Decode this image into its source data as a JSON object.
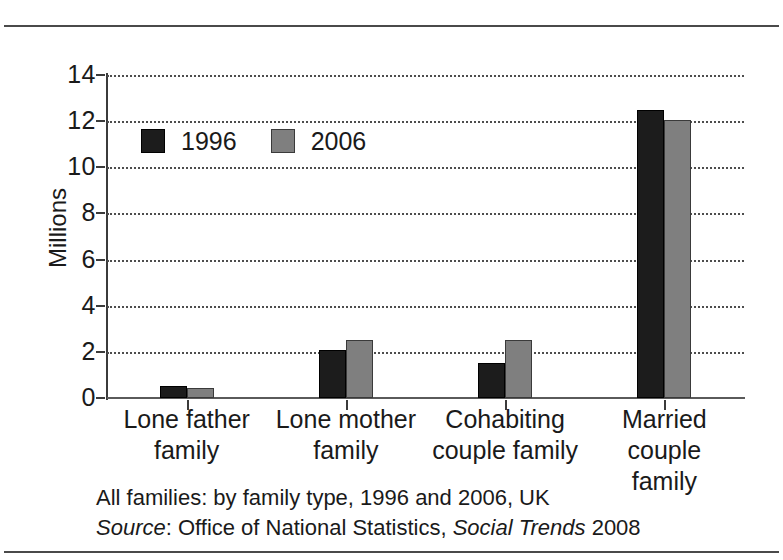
{
  "chart_data": {
    "type": "bar",
    "title": "All families: by family type, 1996 and 2006, UK",
    "source": "Source: Office of National Statistics, Social Trends 2008",
    "xlabel": "",
    "ylabel": "Millions",
    "ylim": [
      0,
      14
    ],
    "ytick_values": [
      14,
      12,
      10,
      8,
      6,
      4,
      2,
      0
    ],
    "ytick_labels": [
      "14",
      "12",
      "10",
      "8",
      "6",
      "4",
      "2",
      "0"
    ],
    "grid": true,
    "legend_position": "upper-left-inside",
    "categories": [
      "Lone father family",
      "Lone mother family",
      "Cohabiting couple family",
      "Married couple family"
    ],
    "category_lines": [
      [
        "Lone father",
        "family"
      ],
      [
        "Lone mother",
        "family"
      ],
      [
        "Cohabiting",
        "couple family"
      ],
      [
        "Married couple",
        "family"
      ]
    ],
    "series": [
      {
        "name": "1996",
        "color": "#1c1c1c",
        "values": [
          0.5,
          2.1,
          1.5,
          12.5
        ]
      },
      {
        "name": "2006",
        "color": "#7f7f7f",
        "values": [
          0.45,
          2.5,
          2.5,
          12.05
        ]
      }
    ]
  },
  "caption": {
    "line1": "All families: by family type, 1996 and 2006, UK",
    "line2_source_label": "Source",
    "line2_colon": ": Office of National Statistics, ",
    "line2_italic_title": "Social Trends",
    "line2_year": " 2008"
  },
  "legend": {
    "items": [
      {
        "label": "1996",
        "swatch": "dark-square-swatch"
      },
      {
        "label": "2006",
        "swatch": "gray-square-swatch"
      }
    ]
  },
  "axis": {
    "y_title": "Millions"
  }
}
